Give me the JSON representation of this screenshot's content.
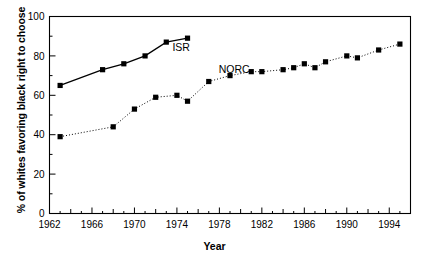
{
  "chart_data": {
    "type": "line",
    "title": "",
    "xlabel": "Year",
    "ylabel": "% of whites favoring black right to choose",
    "xlim": [
      1962,
      1996
    ],
    "ylim": [
      0,
      100
    ],
    "xticks": [
      1962,
      1966,
      1970,
      1974,
      1978,
      1982,
      1986,
      1990,
      1994
    ],
    "xtick_labels": [
      "1962",
      "1966",
      "1970",
      "1974",
      "1978",
      "1982",
      "1986",
      "1990",
      "1994"
    ],
    "x_minor_tick_interval": 1,
    "yticks": [
      0,
      20,
      40,
      60,
      80,
      100
    ],
    "ytick_labels": [
      "0",
      "20",
      "40",
      "60",
      "80",
      "100"
    ],
    "y_minor_tick_interval": 10,
    "grid": false,
    "legend_position": "inline-annotation",
    "series": [
      {
        "name": "ISR",
        "label": "ISR",
        "line_style": "solid",
        "marker": "square",
        "color": "#000000",
        "label_x": 1974.4,
        "label_y": 82.5,
        "points": [
          {
            "x": 1963,
            "y": 65
          },
          {
            "x": 1967,
            "y": 73
          },
          {
            "x": 1969,
            "y": 76
          },
          {
            "x": 1971,
            "y": 80
          },
          {
            "x": 1973,
            "y": 87
          },
          {
            "x": 1975,
            "y": 89
          }
        ]
      },
      {
        "name": "NORC",
        "label": "NORC",
        "line_style": "dotted",
        "marker": "square",
        "color": "#000000",
        "label_x": 1979.4,
        "label_y": 71.5,
        "points": [
          {
            "x": 1963,
            "y": 39
          },
          {
            "x": 1968,
            "y": 44
          },
          {
            "x": 1970,
            "y": 53
          },
          {
            "x": 1972,
            "y": 59
          },
          {
            "x": 1974,
            "y": 60
          },
          {
            "x": 1975,
            "y": 57
          },
          {
            "x": 1977,
            "y": 67
          },
          {
            "x": 1979,
            "y": 70
          },
          {
            "x": 1981,
            "y": 72
          },
          {
            "x": 1982,
            "y": 72
          },
          {
            "x": 1984,
            "y": 73
          },
          {
            "x": 1985,
            "y": 74
          },
          {
            "x": 1986,
            "y": 76
          },
          {
            "x": 1987,
            "y": 74
          },
          {
            "x": 1988,
            "y": 77
          },
          {
            "x": 1990,
            "y": 80
          },
          {
            "x": 1991,
            "y": 79
          },
          {
            "x": 1993,
            "y": 83
          },
          {
            "x": 1995,
            "y": 86
          }
        ]
      }
    ]
  },
  "axis": {
    "x_title": "Year",
    "y_title": "% of whites favoring black right to choose"
  }
}
